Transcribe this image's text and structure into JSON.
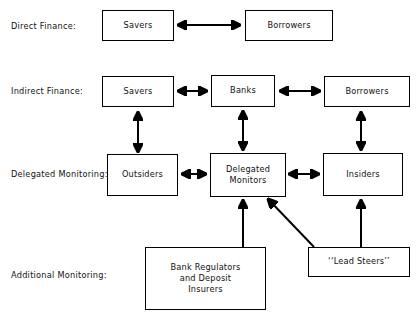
{
  "diagram": {
    "title_rows": [
      {
        "id": "direct-finance",
        "label": "Direct Finance:"
      },
      {
        "id": "indirect-finance",
        "label": "Indirect Finance:"
      },
      {
        "id": "delegated-monitoring",
        "label": "Delegated Monitoring:"
      },
      {
        "id": "additional-monitoring",
        "label": "Additional Monitoring:"
      }
    ],
    "nodes": [
      {
        "id": "savers-direct",
        "label": "Savers"
      },
      {
        "id": "borrowers-direct",
        "label": "Borrowers"
      },
      {
        "id": "savers-indirect",
        "label": "Savers"
      },
      {
        "id": "banks",
        "label": "Banks"
      },
      {
        "id": "borrowers-indirect",
        "label": "Borrowers"
      },
      {
        "id": "outsiders",
        "label": "Outsiders"
      },
      {
        "id": "delegated-monitors",
        "label": "Delegated\nMonitors"
      },
      {
        "id": "insiders",
        "label": "Insiders"
      },
      {
        "id": "bank-regulators",
        "label": "Bank Regulators\nand Deposit\nInsurers"
      },
      {
        "id": "lead-steers",
        "label": "‘‘Lead Steers’’"
      }
    ],
    "colors": {
      "stroke": "#000000",
      "background": "#ffffff",
      "text": "#111111"
    },
    "edges": [
      {
        "id": "savers-direct--borrowers-direct",
        "kind": "double-horizontal"
      },
      {
        "id": "savers-indirect--banks",
        "kind": "double-horizontal"
      },
      {
        "id": "banks--borrowers-indirect",
        "kind": "double-horizontal"
      },
      {
        "id": "outsiders--savers-indirect",
        "kind": "double-vertical"
      },
      {
        "id": "delegated-monitors--banks",
        "kind": "double-vertical"
      },
      {
        "id": "insiders--borrowers-indirect",
        "kind": "double-vertical"
      },
      {
        "id": "outsiders--delegated-monitors",
        "kind": "double-horizontal"
      },
      {
        "id": "delegated-monitors--insiders",
        "kind": "double-horizontal"
      },
      {
        "id": "bank-regulators--delegated-monitors",
        "kind": "single-up"
      },
      {
        "id": "lead-steers--insiders",
        "kind": "single-up"
      },
      {
        "id": "lead-steers--delegated-monitors",
        "kind": "single-diagonal"
      }
    ]
  }
}
